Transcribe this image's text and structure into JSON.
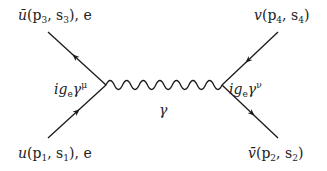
{
  "diagram": {
    "type": "feynman",
    "process": "e- e+ annihilation via photon (s-channel)",
    "colors": {
      "line": "#1a1a1a",
      "text": "#222222",
      "background": "#ffffff"
    },
    "labels": {
      "top_left": {
        "base": "ū",
        "args_open": "(p",
        "p_sub": "3",
        "sep": ", s",
        "s_sub": "3",
        "args_close": "), e"
      },
      "top_right": {
        "base": "v",
        "args_open": "(p",
        "p_sub": "4",
        "sep": ", s",
        "s_sub": "4",
        "args_close": ")"
      },
      "bottom_left": {
        "base": "u",
        "args_open": "(p",
        "p_sub": "1",
        "sep": ", s",
        "s_sub": "1",
        "args_close": "), e"
      },
      "bottom_right": {
        "base": "v̄",
        "args_open": "(p",
        "p_sub": "2",
        "sep": ", s",
        "s_sub": "2",
        "args_close": ")"
      },
      "vertex_left": {
        "prefix": "ig",
        "sub": "e",
        "gamma": "γ",
        "sup": "μ"
      },
      "vertex_right": {
        "prefix": "ig",
        "sub": "e",
        "gamma": "γ",
        "sup": "ν"
      },
      "propagator": "γ"
    },
    "vertices": [
      {
        "name": "left",
        "x": 106,
        "y": 85
      },
      {
        "name": "right",
        "x": 222,
        "y": 85
      }
    ],
    "external_lines": [
      {
        "name": "incoming-electron",
        "from": [
          48,
          138
        ],
        "to": [
          106,
          85
        ],
        "arrow": "toward-vertex"
      },
      {
        "name": "outgoing-electron",
        "from": [
          106,
          85
        ],
        "to": [
          48,
          32
        ],
        "arrow": "toward-vertex"
      },
      {
        "name": "outgoing-positron-spinor-v",
        "from": [
          278,
          32
        ],
        "to": [
          222,
          85
        ],
        "arrow": "toward-vertex"
      },
      {
        "name": "incoming-positron-spinor-vbar",
        "from": [
          222,
          85
        ],
        "to": [
          278,
          138
        ],
        "arrow": "away-from-vertex"
      }
    ],
    "photon": {
      "from": [
        106,
        85
      ],
      "to": [
        222,
        85
      ],
      "wiggles": 7
    }
  }
}
